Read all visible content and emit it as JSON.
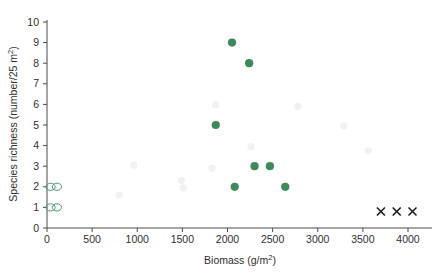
{
  "chart_data": {
    "type": "scatter",
    "title": "",
    "xlabel": "Biomass (g/m2)",
    "xlabel_base": "Biomass (g/m",
    "xlabel_sup": "2",
    "xlabel_tail": ")",
    "ylabel": "Species richness (number/25 m2)",
    "ylabel_base": "Species richness (number/25  m",
    "ylabel_sup": "2",
    "ylabel_tail": ")",
    "xlim": [
      0,
      4300
    ],
    "ylim": [
      0,
      10.6
    ],
    "xticks": [
      0,
      500,
      1000,
      1500,
      2000,
      2500,
      3000,
      3500,
      4000
    ],
    "xtick_labels": [
      "0",
      "500",
      "1000",
      "1500",
      "2000",
      "2500",
      "3000",
      "3500",
      "4000"
    ],
    "yticks": [
      0,
      1,
      2,
      3,
      4,
      5,
      6,
      7,
      8,
      9,
      10
    ],
    "ytick_labels": [
      "0",
      "1",
      "2",
      "3",
      "4",
      "5",
      "6",
      "7",
      "8",
      "9",
      "10"
    ],
    "grid": false,
    "legend": "none",
    "series": [
      {
        "name": "filled-circles",
        "marker": "filled-circle",
        "color": "#3f8a5c",
        "points": [
          {
            "x": 2050,
            "y": 9
          },
          {
            "x": 2240,
            "y": 8
          },
          {
            "x": 1870,
            "y": 5
          },
          {
            "x": 2300,
            "y": 3
          },
          {
            "x": 2470,
            "y": 3
          },
          {
            "x": 2080,
            "y": 2
          },
          {
            "x": 2640,
            "y": 2
          }
        ]
      },
      {
        "name": "open-circles",
        "marker": "open-circle",
        "color": "#4f9c6e",
        "points": [
          {
            "x": 40,
            "y": 2
          },
          {
            "x": 110,
            "y": 2
          },
          {
            "x": 40,
            "y": 1
          },
          {
            "x": 110,
            "y": 1
          }
        ]
      },
      {
        "name": "x-markers",
        "marker": "x",
        "color": "#1d1d1d",
        "points": [
          {
            "x": 3700,
            "y": 0.8
          },
          {
            "x": 3875,
            "y": 0.8
          },
          {
            "x": 4050,
            "y": 0.8
          }
        ]
      }
    ],
    "faint_markers": [
      {
        "x": 1870,
        "y": 6
      },
      {
        "x": 2780,
        "y": 5.9
      },
      {
        "x": 1880,
        "y": 5.05
      },
      {
        "x": 3290,
        "y": 4.95
      },
      {
        "x": 2260,
        "y": 3.95
      },
      {
        "x": 3560,
        "y": 3.75
      },
      {
        "x": 960,
        "y": 3.05
      },
      {
        "x": 1830,
        "y": 2.9
      },
      {
        "x": 1490,
        "y": 2.3
      },
      {
        "x": 1510,
        "y": 1.95
      },
      {
        "x": 800,
        "y": 1.6
      }
    ]
  },
  "figure": {
    "background": "#ffffff",
    "axis_color": "#4a4a4a",
    "accent_green": "#3f8a5c",
    "open_green": "#4f9c6e",
    "x_marker_color": "#1d1d1d"
  }
}
